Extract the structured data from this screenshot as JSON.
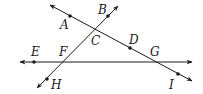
{
  "diagram": {
    "type": "geometry-lines",
    "colors": {
      "line": "#1a1a1a",
      "background": "#ffffff"
    },
    "lines": [
      {
        "id": "line-AI",
        "points": [
          "A",
          "C",
          "D",
          "G",
          "I"
        ],
        "from": [
          50,
          5
        ],
        "to": [
          192,
          81
        ],
        "arrows": "both"
      },
      {
        "id": "line-BH",
        "points": [
          "B",
          "C",
          "F",
          "H"
        ],
        "from": [
          118,
          6
        ],
        "to": [
          37,
          88
        ],
        "arrows": "both"
      },
      {
        "id": "line-EG",
        "points": [
          "E",
          "F",
          "G"
        ],
        "from": [
          20,
          62
        ],
        "to": [
          192,
          62
        ],
        "arrows": "both"
      }
    ],
    "points": [
      {
        "name": "A",
        "x": 70,
        "y": 16,
        "dot": true,
        "label_x": 60,
        "label_y": 29
      },
      {
        "name": "B",
        "x": 108,
        "y": 16,
        "dot": true,
        "label_x": 98,
        "label_y": 14
      },
      {
        "name": "C",
        "x": 96,
        "y": 30,
        "dot": false,
        "label_x": 91,
        "label_y": 45
      },
      {
        "name": "D",
        "x": 130,
        "y": 48,
        "dot": true,
        "label_x": 129,
        "label_y": 44
      },
      {
        "name": "E",
        "x": 34,
        "y": 62,
        "dot": true,
        "label_x": 31,
        "label_y": 56
      },
      {
        "name": "F",
        "x": 64,
        "y": 62,
        "dot": false,
        "label_x": 59,
        "label_y": 56
      },
      {
        "name": "G",
        "x": 155,
        "y": 62,
        "dot": false,
        "label_x": 150,
        "label_y": 56
      },
      {
        "name": "H",
        "x": 47,
        "y": 79,
        "dot": true,
        "label_x": 51,
        "label_y": 89
      },
      {
        "name": "I",
        "x": 178,
        "y": 74,
        "dot": true,
        "label_x": 169,
        "label_y": 89
      }
    ]
  }
}
